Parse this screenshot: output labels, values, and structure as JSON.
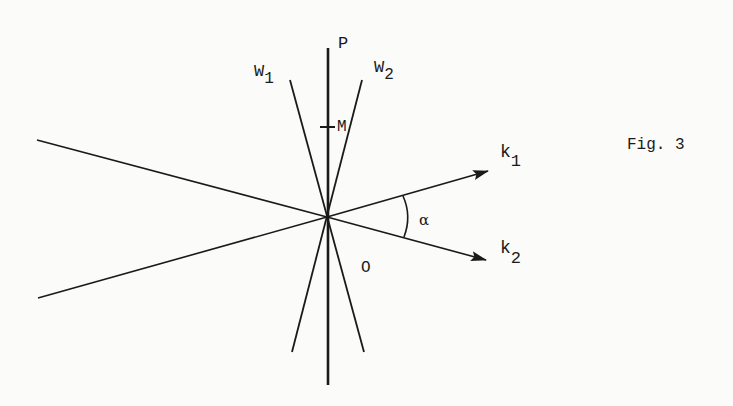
{
  "figure": {
    "caption": "Fig. 3",
    "labels": {
      "P": "P",
      "M": "M",
      "O": "O",
      "W1": {
        "base": "W",
        "sub": "1"
      },
      "W2": {
        "base": "W",
        "sub": "2"
      },
      "k1": {
        "base": "k",
        "sub": "1"
      },
      "k2": {
        "base": "k",
        "sub": "2"
      },
      "alpha": "α"
    },
    "origin": [
      327,
      217
    ],
    "colors": {
      "ink": "#1a1a1a",
      "paper": "#fbfbf9"
    }
  }
}
